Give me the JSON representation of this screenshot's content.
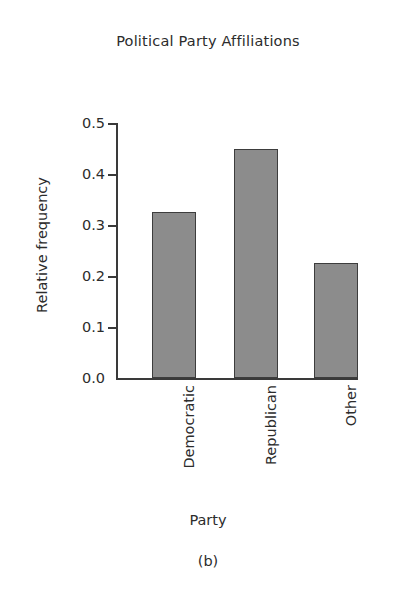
{
  "figure": {
    "background_color": "#ffffff",
    "panel_caption": "(b)"
  },
  "chart_data": {
    "type": "bar",
    "title": "Political Party Affiliations",
    "xlabel": "Party",
    "ylabel": "Relative frequency",
    "categories": [
      "Democratic",
      "Republican",
      "Other"
    ],
    "values": [
      0.325,
      0.45,
      0.225
    ],
    "ylim": [
      0.0,
      0.5
    ],
    "ytick_labels": [
      "0.0",
      "0.1",
      "0.2",
      "0.3",
      "0.4",
      "0.5"
    ],
    "ytick_values": [
      0.0,
      0.1,
      0.2,
      0.3,
      0.4,
      0.5
    ],
    "grid": false,
    "legend": false,
    "bar_fill_color": "#8c8c8c",
    "bar_edge_color": "#3d3d3d",
    "axis_color": "#3a3a3a",
    "text_color": "#2c2c2c",
    "xtick_label_rotation": 90
  }
}
